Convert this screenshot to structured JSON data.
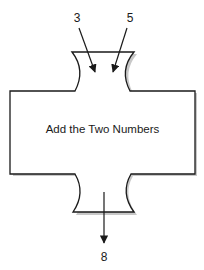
{
  "diagram": {
    "type": "process-block",
    "process_label": "Add the Two Numbers",
    "inputs": [
      {
        "label": "3"
      },
      {
        "label": "5"
      }
    ],
    "output": {
      "label": "8"
    },
    "colors": {
      "stroke": "#1a1a1a",
      "shadow": "#b0b0b0",
      "fill": "#ffffff"
    }
  }
}
